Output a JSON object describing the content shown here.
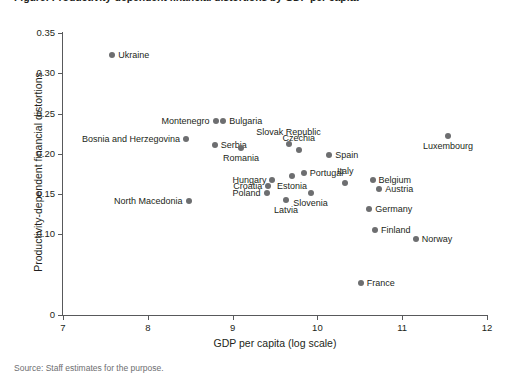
{
  "chart_data": {
    "type": "scatter",
    "title": "Figure: Productivity-dependent financial distortions by GDP per capita",
    "xlabel": "GDP per capita (log scale)",
    "ylabel": "Productivity-dependent financial distortions",
    "xlim": [
      7,
      12
    ],
    "ylim": [
      0,
      0.35
    ],
    "xticks": [
      "7",
      "8",
      "9",
      "10",
      "11",
      "12"
    ],
    "xtick_values": [
      7,
      8,
      9,
      10,
      11,
      12
    ],
    "yticks": [
      "0",
      "0.10",
      "0.15",
      "0.20",
      "0.25",
      "0.30",
      "0.35"
    ],
    "ytick_values": [
      0,
      0.1,
      0.15,
      0.2,
      0.25,
      0.3,
      0.35
    ],
    "grid": false,
    "legend": "none",
    "marker_color": "#6d6e70",
    "axis_color": "#58595b",
    "points": [
      {
        "label": "Ukraine",
        "x": 7.58,
        "y": 0.323,
        "pos": "right"
      },
      {
        "label": "Montenegro",
        "x": 8.8,
        "y": 0.241,
        "pos": "left"
      },
      {
        "label": "Bulgaria",
        "x": 8.89,
        "y": 0.241,
        "pos": "right"
      },
      {
        "label": "Bosnia and Herzegovina",
        "x": 8.45,
        "y": 0.218,
        "pos": "left"
      },
      {
        "label": "Serbia",
        "x": 8.79,
        "y": 0.211,
        "pos": "right"
      },
      {
        "label": "Romania",
        "x": 9.1,
        "y": 0.207,
        "pos": "below"
      },
      {
        "label": "Slovak Republic",
        "x": 9.66,
        "y": 0.212,
        "pos": "above"
      },
      {
        "label": "Czechia",
        "x": 9.78,
        "y": 0.205,
        "pos": "above"
      },
      {
        "label": "Spain",
        "x": 10.14,
        "y": 0.198,
        "pos": "right"
      },
      {
        "label": "Luxembourg",
        "x": 11.54,
        "y": 0.222,
        "pos": "below"
      },
      {
        "label": "Portugal",
        "x": 9.84,
        "y": 0.176,
        "pos": "right"
      },
      {
        "label": "Estonia",
        "x": 9.7,
        "y": 0.172,
        "pos": "below"
      },
      {
        "label": "Hungary",
        "x": 9.47,
        "y": 0.168,
        "pos": "left"
      },
      {
        "label": "Belgium",
        "x": 10.65,
        "y": 0.167,
        "pos": "right"
      },
      {
        "label": "Italy",
        "x": 10.33,
        "y": 0.164,
        "pos": "above"
      },
      {
        "label": "Croatia",
        "x": 9.42,
        "y": 0.16,
        "pos": "left"
      },
      {
        "label": "Austria",
        "x": 10.73,
        "y": 0.157,
        "pos": "right"
      },
      {
        "label": "Poland",
        "x": 9.4,
        "y": 0.152,
        "pos": "left"
      },
      {
        "label": "Slovenia",
        "x": 9.92,
        "y": 0.152,
        "pos": "below"
      },
      {
        "label": "Latvia",
        "x": 9.63,
        "y": 0.143,
        "pos": "below"
      },
      {
        "label": "North Macedonia",
        "x": 8.48,
        "y": 0.142,
        "pos": "left"
      },
      {
        "label": "Germany",
        "x": 10.61,
        "y": 0.131,
        "pos": "right"
      },
      {
        "label": "Finland",
        "x": 10.68,
        "y": 0.106,
        "pos": "right"
      },
      {
        "label": "Norway",
        "x": 11.16,
        "y": 0.094,
        "pos": "right"
      },
      {
        "label": "France",
        "x": 10.51,
        "y": 0.04,
        "pos": "right"
      }
    ]
  },
  "source_note": "Source: Staff estimates for the purpose."
}
